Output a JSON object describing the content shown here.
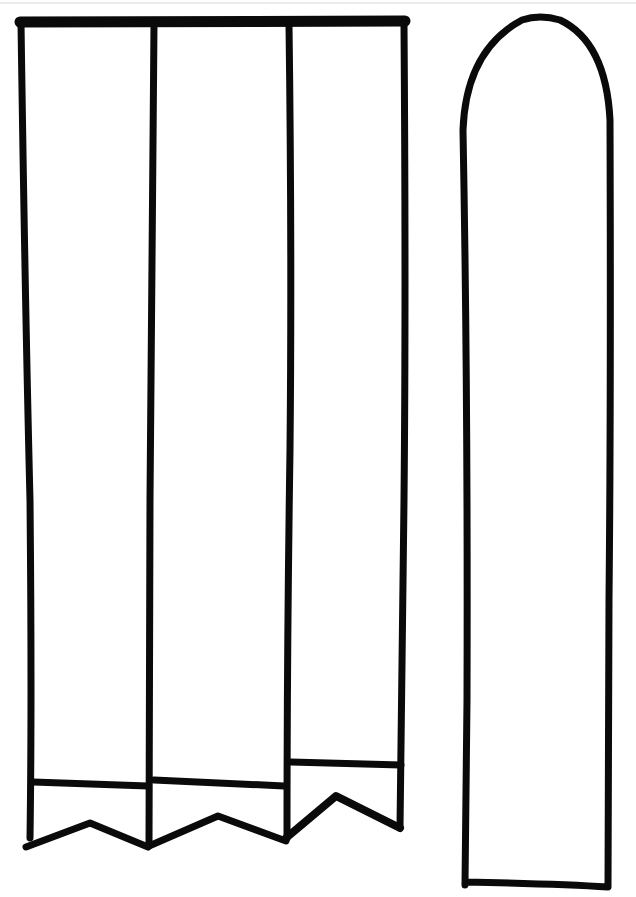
{
  "page": {
    "type": "printable paper craft template",
    "background_color": "#ffffff",
    "ink_color": "#0a0a0a",
    "scan_edge_color": "#ececec"
  },
  "template": {
    "banner_panels": {
      "count": 3,
      "shape": "vertical strips with pennant (swallowtail/V-notch) bottoms and a horizontal band line above the notch",
      "panels": [
        {
          "index": 1,
          "label": "panel-1"
        },
        {
          "index": 2,
          "label": "panel-2"
        },
        {
          "index": 3,
          "label": "panel-3"
        }
      ]
    },
    "arch_strip": {
      "count": 1,
      "shape": "tall strip with rounded arch top and flat bottom"
    }
  }
}
